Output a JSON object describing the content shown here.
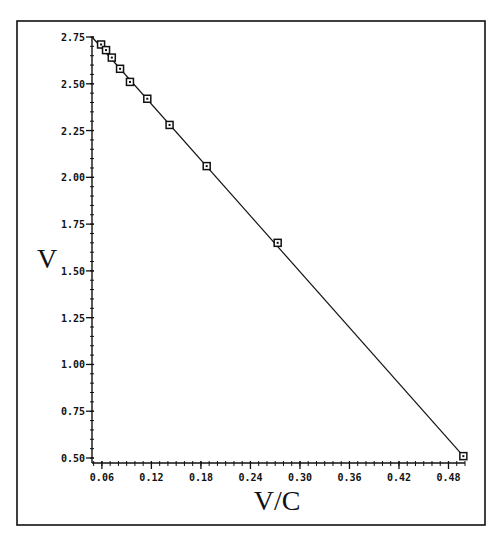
{
  "chart_data": {
    "type": "scatter",
    "title": "",
    "xlabel": "V/C",
    "ylabel": "V",
    "xlim": [
      0.048,
      0.5
    ],
    "ylim": [
      0.5,
      2.75
    ],
    "xticks": [
      0.06,
      0.12,
      0.18,
      0.24,
      0.3,
      0.36,
      0.42,
      0.48
    ],
    "xtick_labels": [
      "0.06",
      "0.12",
      "0.18",
      "0.24",
      "0.30",
      "0.36",
      "0.42",
      "0.48"
    ],
    "yticks": [
      0.5,
      0.75,
      1.0,
      1.25,
      1.5,
      1.75,
      2.0,
      2.25,
      2.5,
      2.75
    ],
    "ytick_labels": [
      "0.50",
      "0.75",
      "1.00",
      "1.25",
      "1.50",
      "1.75",
      "2.00",
      "2.25",
      "2.50",
      "2.75"
    ],
    "grid": false,
    "legend": null,
    "series": [
      {
        "name": "data",
        "marker": "square",
        "x": [
          0.059,
          0.065,
          0.072,
          0.082,
          0.094,
          0.115,
          0.142,
          0.187,
          0.273,
          0.498
        ],
        "y": [
          2.71,
          2.68,
          2.64,
          2.58,
          2.51,
          2.42,
          2.28,
          2.06,
          1.65,
          0.51
        ]
      },
      {
        "name": "fit-line",
        "style": "line",
        "x": [
          0.048,
          0.498
        ],
        "y": [
          2.75,
          0.51
        ]
      }
    ]
  }
}
